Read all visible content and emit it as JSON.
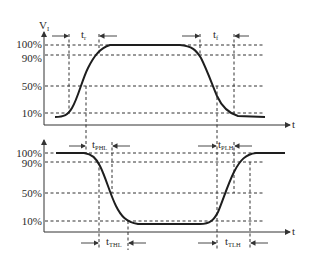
{
  "diagram": {
    "type": "timing-diagram",
    "top": {
      "y_axis_label": "V",
      "y_axis_label_sub": "I",
      "x_axis_label": "t",
      "levels": [
        "100%",
        "90%",
        "50%",
        "10%"
      ],
      "markers": [
        {
          "label": "t",
          "sub": "r"
        },
        {
          "label": "t",
          "sub": "f"
        }
      ]
    },
    "bottom": {
      "x_axis_label": "t",
      "levels": [
        "100%",
        "90%",
        "50%",
        "10%"
      ],
      "markers": [
        {
          "label": "t",
          "sub": "PHL"
        },
        {
          "label": "t",
          "sub": "PLH"
        },
        {
          "label": "t",
          "sub": "THL"
        },
        {
          "label": "t",
          "sub": "TLH"
        }
      ]
    }
  }
}
